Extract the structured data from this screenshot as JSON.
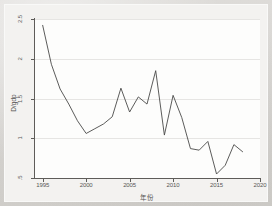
{
  "chart_data": {
    "type": "line",
    "title": "",
    "xlabel": "年份",
    "ylabel": "D/gdp",
    "xlim": [
      1994,
      2020
    ],
    "ylim": [
      0.5,
      2.5
    ],
    "grid": true,
    "legend": "none",
    "x_ticks": [
      "1995",
      "2000",
      "2005",
      "2010",
      "2015",
      "2020"
    ],
    "x_tick_values": [
      1995,
      2000,
      2005,
      2010,
      2015,
      2020
    ],
    "y_ticks": [
      ".5",
      "1",
      "1.5",
      "2",
      "2.5"
    ],
    "y_tick_values": [
      0.5,
      1,
      1.5,
      2,
      2.5
    ],
    "series": [
      {
        "name": "D/gdp",
        "x": [
          1995,
          1996,
          1997,
          1998,
          1999,
          2000,
          2001,
          2002,
          2003,
          2004,
          2005,
          2006,
          2007,
          2008,
          2009,
          2010,
          2011,
          2012,
          2013,
          2014,
          2015,
          2016,
          2017,
          2018
        ],
        "values": [
          2.42,
          1.93,
          1.62,
          1.43,
          1.22,
          1.06,
          1.12,
          1.18,
          1.27,
          1.63,
          1.33,
          1.52,
          1.43,
          1.85,
          1.04,
          1.54,
          1.26,
          0.87,
          0.85,
          0.96,
          0.55,
          0.66,
          0.92,
          0.83
        ]
      }
    ]
  },
  "axes": {
    "y_title": "D/gdp",
    "x_title": "年份"
  }
}
